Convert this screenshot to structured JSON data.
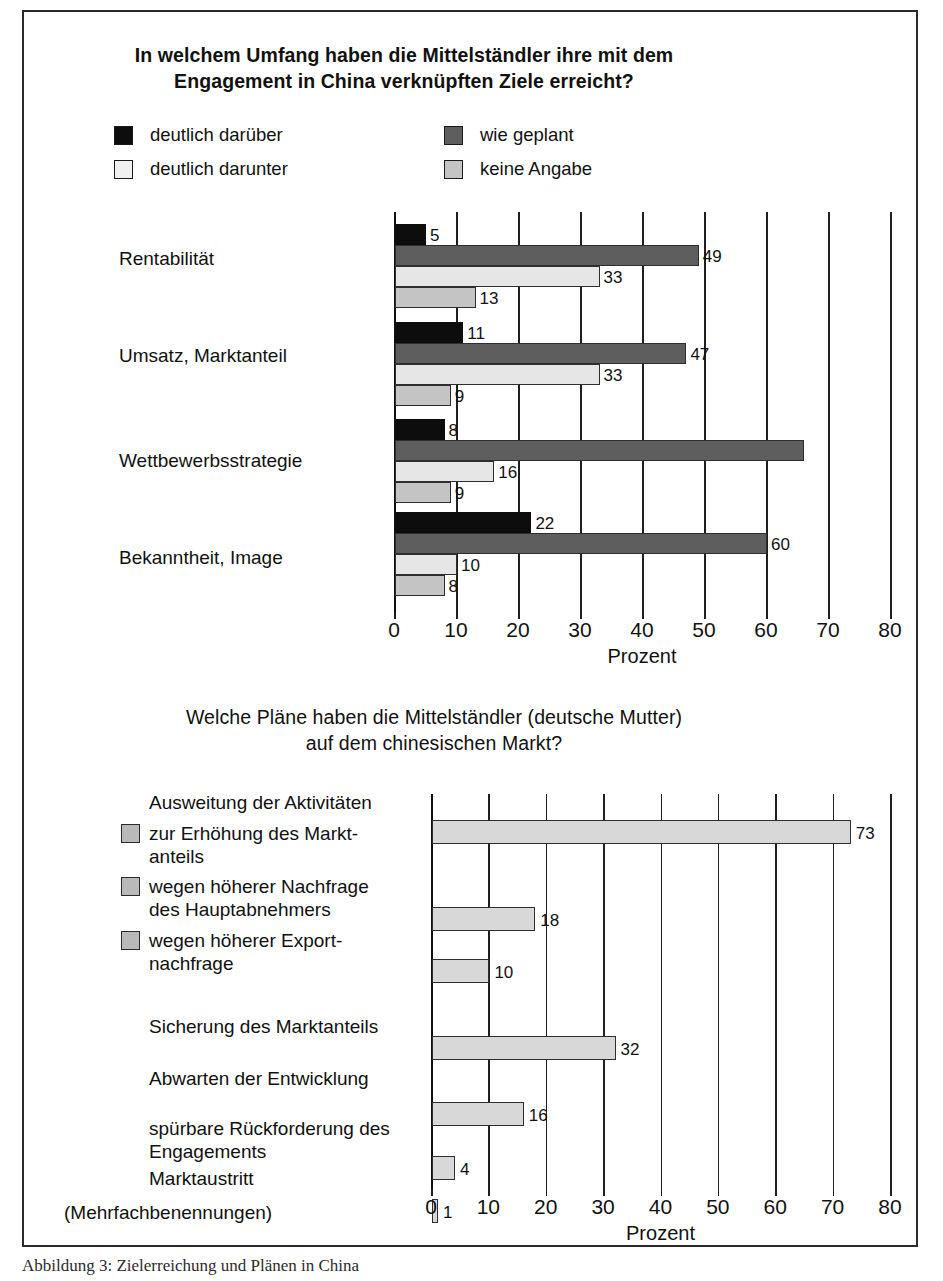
{
  "chart_data": [
    {
      "type": "bar",
      "orientation": "horizontal",
      "title": "In welchem Umfang haben die Mittelständler ihre mit dem Engagement in China verknüpften Ziele erreicht?",
      "title_lines": [
        "In welchem Umfang haben die Mittelständler ihre mit dem",
        "Engagement in China verknüpften Ziele erreicht?"
      ],
      "xlabel": "Prozent",
      "ylabel": "",
      "xlim": [
        0,
        80
      ],
      "xticks": [
        0,
        10,
        20,
        30,
        40,
        50,
        60,
        70,
        80
      ],
      "grid": true,
      "legend_position": "top",
      "categories": [
        "Rentabilität",
        "Umsatz, Marktanteil",
        "Wettbewerbsstrategie",
        "Bekanntheit, Image"
      ],
      "series": [
        {
          "name": "deutlich darüber",
          "color": "#0d0d0d",
          "values": [
            5,
            11,
            8,
            22
          ],
          "labels": [
            "5",
            "11",
            "8",
            "22"
          ]
        },
        {
          "name": "wie geplant",
          "color": "#5e5e5e",
          "values": [
            49,
            47,
            66,
            60
          ],
          "labels": [
            "49",
            "47",
            "",
            "60"
          ]
        },
        {
          "name": "deutlich darunter",
          "color": "#e6e6e6",
          "values": [
            33,
            33,
            16,
            10
          ],
          "labels": [
            "33",
            "33",
            "16",
            "10"
          ]
        },
        {
          "name": "keine Angabe",
          "color": "#c4c4c4",
          "values": [
            13,
            9,
            9,
            8
          ],
          "labels": [
            "13",
            "9",
            "9",
            "8"
          ]
        }
      ]
    },
    {
      "type": "bar",
      "orientation": "horizontal",
      "title": "Welche Pläne haben die Mittelständler (deutsche Mutter) auf dem chinesischen Markt?",
      "title_lines": [
        "Welche Pläne haben die Mittelständler (deutsche Mutter)",
        "auf dem chinesischen Markt?"
      ],
      "xlabel": "Prozent",
      "ylabel": "",
      "xlim": [
        0,
        80
      ],
      "xticks": [
        0,
        10,
        20,
        30,
        40,
        50,
        60,
        70,
        80
      ],
      "grid": true,
      "group_heading": "Ausweitung der Aktivitäten",
      "footnote": "(Mehrfachbenennungen)",
      "categories": [
        "zur Erhöhung des Marktanteils",
        "wegen höherer Nachfrage des Hauptabnehmers",
        "wegen höherer Exportnachfrage",
        "Sicherung des Marktanteils",
        "Abwarten der Entwicklung",
        "spürbare Rückforderung des Engagements",
        "Marktaustritt"
      ],
      "values": [
        73,
        18,
        10,
        32,
        16,
        4,
        1
      ],
      "labels": [
        "73",
        "18",
        "10",
        "32",
        "16",
        "4",
        "1"
      ],
      "bar_color": "#d8d8d8"
    }
  ],
  "chart1": {
    "title_line1": "In welchem Umfang haben die Mittelständler ihre mit dem",
    "title_line2": "Engagement in China verknüpften Ziele erreicht?",
    "legend": [
      {
        "label": "deutlich darüber",
        "swatch": "#0d0d0d"
      },
      {
        "label": "wie geplant",
        "swatch": "#5e5e5e"
      },
      {
        "label": "deutlich darunter",
        "swatch": "#f0f0f0"
      },
      {
        "label": "keine Angabe",
        "swatch": "#c4c4c4"
      }
    ],
    "categories": [
      {
        "label": "Rentabilität"
      },
      {
        "label": "Umsatz, Marktanteil"
      },
      {
        "label": "Wettbewerbsstrategie"
      },
      {
        "label": "Bekanntheit, Image"
      }
    ],
    "axis": {
      "ticks": [
        "0",
        "10",
        "20",
        "30",
        "40",
        "50",
        "60",
        "70",
        "80"
      ],
      "title": "Prozent"
    }
  },
  "chart2": {
    "title_line1": "Welche Pläne haben die Mittelständler (deutsche Mutter)",
    "title_line2": "auf dem chinesischen Markt?",
    "group_heading": "Ausweitung der Aktivitäten",
    "items": [
      {
        "line1": "zur Erhöhung des Markt-",
        "line2": "anteils",
        "value": "73",
        "swatch": true
      },
      {
        "line1": "wegen höherer Nachfrage",
        "line2": "des Hauptabnehmers",
        "value": "18",
        "swatch": true
      },
      {
        "line1": "wegen höherer Export-",
        "line2": "nachfrage",
        "value": "10",
        "swatch": true
      },
      {
        "line1": "Sicherung des Marktanteils",
        "line2": "",
        "value": "32",
        "swatch": false
      },
      {
        "line1": "Abwarten der Entwicklung",
        "line2": "",
        "value": "16",
        "swatch": false
      },
      {
        "line1": "spürbare Rückforderung des",
        "line2": "Engagements",
        "value": "4",
        "swatch": false
      },
      {
        "line1": "Marktaustritt",
        "line2": "",
        "value": "1",
        "swatch": false
      }
    ],
    "footnote": "(Mehrfachbenennungen)",
    "axis": {
      "ticks": [
        "0",
        "10",
        "20",
        "30",
        "40",
        "50",
        "60",
        "70",
        "80"
      ],
      "title": "Prozent"
    }
  },
  "caption": "Abbildung 3: Zielerreichung und Plänen in China"
}
